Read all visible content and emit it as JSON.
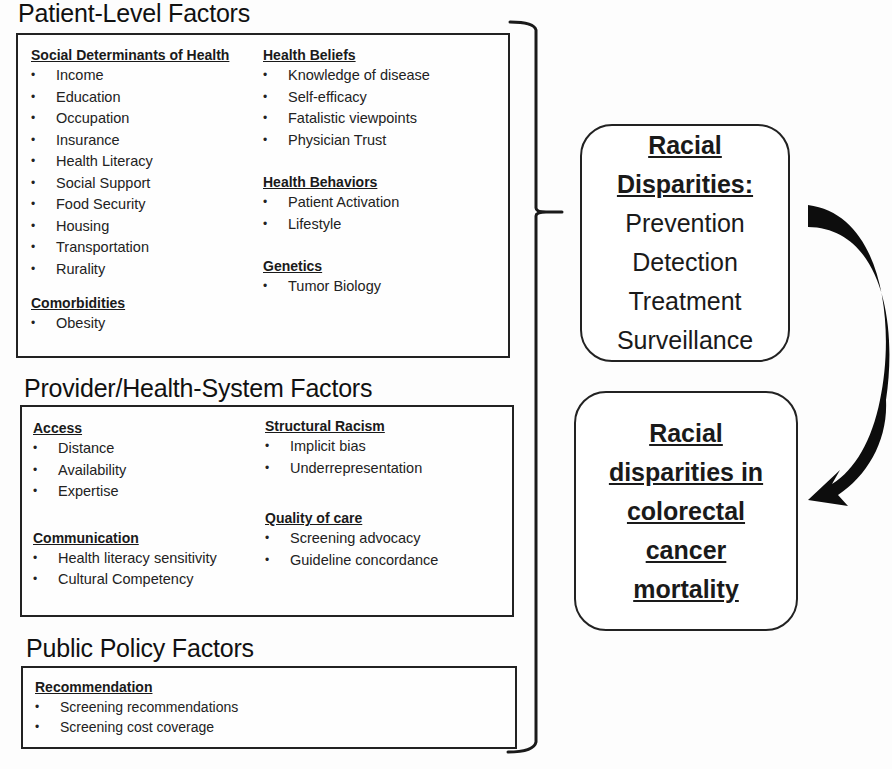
{
  "sections": {
    "patient": {
      "title": "Patient-Level Factors",
      "groups": {
        "sdoh": {
          "title": "Social Determinants of Health",
          "items": [
            "Income",
            "Education",
            "Occupation",
            "Insurance",
            "Health Literacy",
            "Social Support",
            "Food Security",
            "Housing",
            "Transportation",
            "Rurality"
          ]
        },
        "comorbidities": {
          "title": "Comorbidities",
          "items": [
            "Obesity"
          ]
        },
        "beliefs": {
          "title": "Health Beliefs",
          "items": [
            "Knowledge of disease",
            "Self-efficacy",
            "Fatalistic viewpoints",
            "Physician Trust"
          ]
        },
        "behaviors": {
          "title": "Health Behaviors",
          "items": [
            "Patient Activation",
            "Lifestyle"
          ]
        },
        "genetics": {
          "title": "Genetics",
          "items": [
            "Tumor Biology"
          ]
        }
      }
    },
    "provider": {
      "title": "Provider/Health-System Factors",
      "groups": {
        "access": {
          "title": "Access",
          "items": [
            "Distance",
            "Availability",
            "Expertise"
          ]
        },
        "communication": {
          "title": "Communication",
          "items": [
            "Health literacy sensitivity",
            "Cultural Competency"
          ]
        },
        "racism": {
          "title": "Structural Racism",
          "items": [
            "Implicit bias",
            "Underrepresentation"
          ]
        },
        "quality": {
          "title": "Quality of care",
          "items": [
            "Screening advocacy",
            "Guideline concordance"
          ]
        }
      }
    },
    "policy": {
      "title": "Public Policy Factors",
      "groups": {
        "recommendation": {
          "title": "Recommendation",
          "items": [
            "Screening  recommendations",
            "Screening cost coverage"
          ]
        }
      }
    }
  },
  "outcomes": {
    "disparities": {
      "title_lines": [
        "Racial",
        "Disparities:"
      ],
      "lines": [
        "Prevention",
        "Detection",
        "Treatment",
        "Surveillance"
      ]
    },
    "mortality": {
      "title_lines": [
        "Racial",
        "disparities in",
        "colorectal",
        "cancer",
        "mortality"
      ]
    }
  },
  "colors": {
    "stroke": "#222222",
    "text": "#1a1a1a",
    "background": "#fdfdfd"
  }
}
